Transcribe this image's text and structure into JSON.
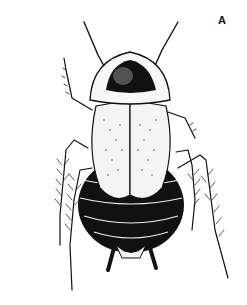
{
  "figure": {
    "panel_label": "A",
    "colors": {
      "background": "#ffffff",
      "ink": "#111111",
      "pale": "#f4f4f4"
    }
  }
}
